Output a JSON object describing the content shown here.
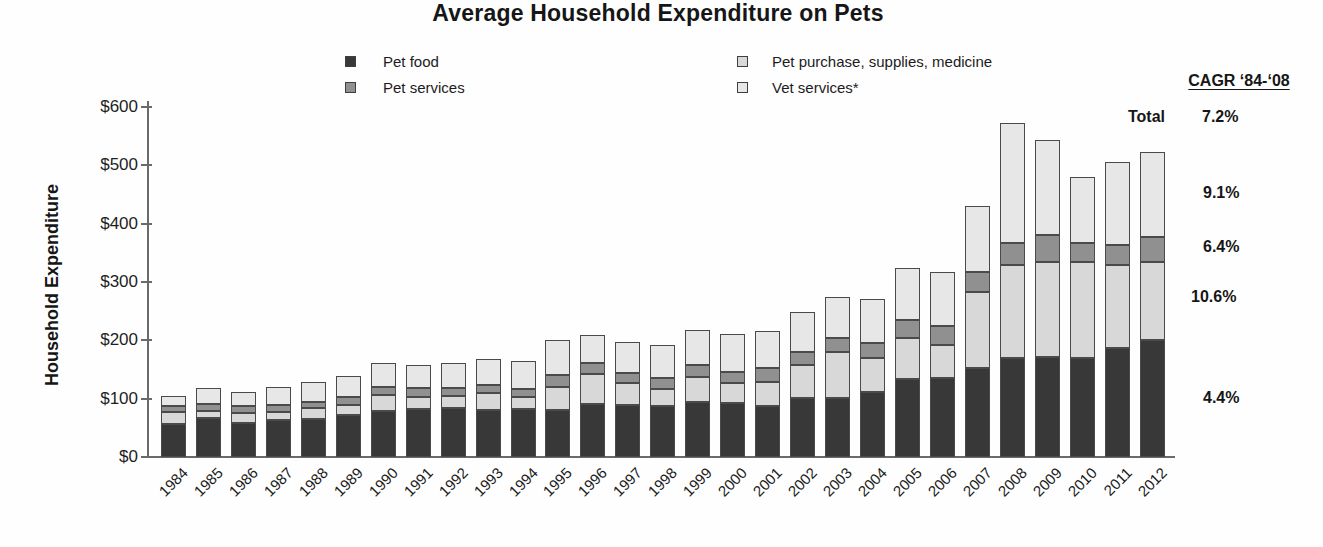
{
  "title": "Average Household Expenditure on Pets",
  "y_axis": {
    "label": "Household Expenditure",
    "ticks": [
      "$0",
      "$100",
      "$200",
      "$300",
      "$400",
      "$500",
      "$600"
    ]
  },
  "legend": [
    {
      "label": "Pet food",
      "color": "#383838"
    },
    {
      "label": "Pet services",
      "color": "#909090"
    },
    {
      "label": "Pet purchase, supplies, medicine",
      "color": "#d8d8d8"
    },
    {
      "label": "Vet services*",
      "color": "#e7e7e7"
    }
  ],
  "cagr": {
    "header": "CAGR ‘84-‘08",
    "total_label": "Total",
    "total_value": "7.2%",
    "rows": [
      {
        "series": "Vet services*",
        "value": "9.1%"
      },
      {
        "series": "Pet services",
        "value": "6.4%"
      },
      {
        "series": "Pet purchase, supplies, medicine",
        "value": "10.6%"
      },
      {
        "series": "Pet food",
        "value": "4.4%"
      }
    ]
  },
  "chart_data": {
    "type": "bar",
    "stacked": true,
    "title": "Average Household Expenditure on Pets",
    "xlabel": "",
    "ylabel": "Household Expenditure",
    "ylim": [
      0,
      600
    ],
    "y_tick_step": 100,
    "grid": false,
    "legend_position": "top",
    "categories": [
      1984,
      1985,
      1986,
      1987,
      1988,
      1989,
      1990,
      1991,
      1992,
      1993,
      1994,
      1995,
      1996,
      1997,
      1998,
      1999,
      2000,
      2001,
      2002,
      2003,
      2004,
      2005,
      2006,
      2007,
      2008,
      2009,
      2010,
      2011,
      2012
    ],
    "stack_order_bottom_to_top": [
      "Pet food",
      "Pet purchase, supplies, medicine",
      "Pet services",
      "Vet services*"
    ],
    "series": [
      {
        "name": "Pet food",
        "color": "#383838",
        "values": [
          57,
          67,
          58,
          63,
          65,
          72,
          79,
          82,
          84,
          81,
          82,
          81,
          91,
          89,
          87,
          94,
          93,
          87,
          101,
          101,
          111,
          134,
          135,
          153,
          170,
          171,
          170,
          187,
          201
        ]
      },
      {
        "name": "Pet purchase, supplies, medicine",
        "color": "#d8d8d8",
        "values": [
          20,
          12,
          17,
          14,
          19,
          17,
          27,
          21,
          21,
          29,
          21,
          39,
          51,
          38,
          30,
          43,
          34,
          42,
          57,
          79,
          59,
          70,
          57,
          130,
          159,
          163,
          164,
          142,
          133
        ]
      },
      {
        "name": "Pet services",
        "color": "#909090",
        "values": [
          10,
          12,
          12,
          12,
          10,
          14,
          14,
          15,
          13,
          13,
          14,
          21,
          19,
          17,
          18,
          21,
          19,
          24,
          22,
          24,
          25,
          31,
          33,
          34,
          38,
          46,
          33,
          34,
          43
        ]
      },
      {
        "name": "Vet services*",
        "color": "#e7e7e7",
        "values": [
          18,
          27,
          24,
          31,
          35,
          36,
          41,
          40,
          43,
          45,
          48,
          60,
          48,
          53,
          57,
          60,
          65,
          63,
          69,
          70,
          76,
          89,
          92,
          113,
          206,
          163,
          113,
          143,
          146
        ]
      }
    ],
    "totals": [
      105,
      118,
      111,
      120,
      129,
      139,
      161,
      158,
      161,
      168,
      165,
      201,
      209,
      197,
      192,
      218,
      211,
      216,
      249,
      274,
      271,
      324,
      317,
      430,
      573,
      543,
      480,
      506,
      523
    ],
    "cagr_84_08": {
      "Total": "7.2%",
      "Vet services*": "9.1%",
      "Pet services": "6.4%",
      "Pet purchase, supplies, medicine": "10.6%",
      "Pet food": "4.4%"
    }
  }
}
